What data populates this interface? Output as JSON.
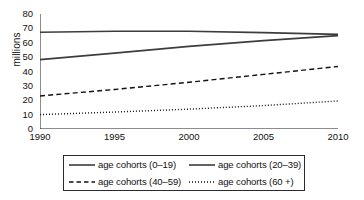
{
  "chart_data": {
    "type": "line",
    "title": "",
    "xlabel": "",
    "ylabel": "millions",
    "xlim": [
      1990,
      2010
    ],
    "ylim": [
      0,
      80
    ],
    "xticks": [
      "1990",
      "1995",
      "2000",
      "2005",
      "2010"
    ],
    "yticks": [
      "0",
      "10",
      "20",
      "30",
      "40",
      "50",
      "60",
      "70",
      "80"
    ],
    "grid": false,
    "legend_position": "below",
    "x": [
      1990,
      1995,
      2000,
      2005,
      2010
    ],
    "series": [
      {
        "name": "age cohorts (0–19)",
        "style": "solid",
        "color": "#3d3d3d",
        "values": [
          67.3,
          68.0,
          68.0,
          67.0,
          65.8
        ]
      },
      {
        "name": "age cohorts (20–39)",
        "style": "solid",
        "color": "#3d3d3d",
        "values": [
          48.3,
          52.8,
          57.5,
          61.5,
          65.0
        ]
      },
      {
        "name": "age cohorts (40–59)",
        "style": "dashed",
        "color": "#111111",
        "values": [
          23.0,
          27.5,
          32.5,
          38.0,
          43.5
        ]
      },
      {
        "name": "age cohorts (60 +)",
        "style": "dotted",
        "color": "#111111",
        "values": [
          10.0,
          11.8,
          13.8,
          16.3,
          19.5
        ]
      }
    ]
  },
  "legend": {
    "items": [
      {
        "label": "age cohorts (0–19)"
      },
      {
        "label": "age cohorts (20–39)"
      },
      {
        "label": "age cohorts (40–59)"
      },
      {
        "label": "age cohorts (60 +)"
      }
    ]
  },
  "axis": {
    "y_title": "millions"
  }
}
